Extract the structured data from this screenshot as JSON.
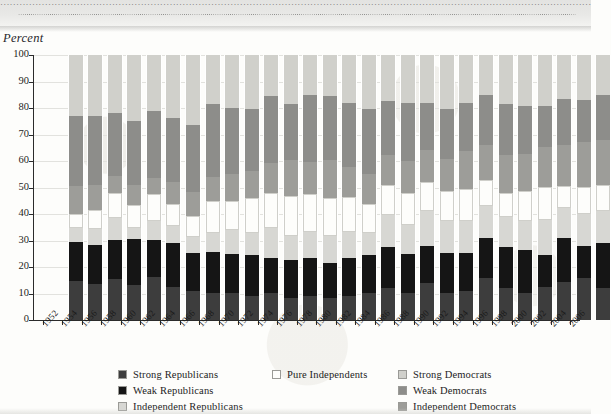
{
  "page": {
    "header_strip_text": "·····································································································································································································"
  },
  "axis": {
    "y_title": "Percent",
    "y_ticks": [
      0,
      10,
      20,
      30,
      40,
      50,
      60,
      70,
      80,
      90,
      100
    ],
    "y_tick_labels": [
      "0",
      "10",
      "20",
      "30",
      "40",
      "50",
      "60",
      "70",
      "80",
      "90",
      "100"
    ]
  },
  "legend": {
    "left": [
      {
        "label": "Strong Republicans",
        "color": "#3d3d3d"
      },
      {
        "label": "Weak Republicans",
        "color": "#151515"
      },
      {
        "label": "Independent Republicans",
        "color": "#d7d7d3"
      }
    ],
    "mid": [
      {
        "label": "Pure Independents",
        "color": "#fdfdfb"
      }
    ],
    "right": [
      {
        "label": "Strong Democrats",
        "color": "#d0d0cb"
      },
      {
        "label": "Weak Democrats",
        "color": "#8d8d8a"
      },
      {
        "label": "Independent Democrats",
        "color": "#9d9d99"
      }
    ]
  },
  "colors": {
    "strong_republicans": "#3d3d3d",
    "weak_republicans": "#151515",
    "independent_republicans": "#d7d7d3",
    "pure_independents": "#fdfdfb",
    "independent_democrats": "#9d9d99",
    "weak_democrats": "#8d8d8a",
    "strong_democrats": "#d0d0cb"
  },
  "chart_data": {
    "type": "bar",
    "stacked": true,
    "title": "",
    "xlabel": "",
    "ylabel": "Percent",
    "ylim": [
      0,
      100
    ],
    "grid": true,
    "legend_position": "bottom",
    "stack_order_bottom_to_top": [
      "Strong Republicans",
      "Weak Republicans",
      "Independent Republicans",
      "Pure Independents",
      "Independent Democrats",
      "Weak Democrats",
      "Strong Democrats"
    ],
    "categories": [
      "1952",
      "1954",
      "1956",
      "1958",
      "1960",
      "1962",
      "1964",
      "1966",
      "1968",
      "1970",
      "1972",
      "1974",
      "1976",
      "1978",
      "1980",
      "1982",
      "1984",
      "1986",
      "1988",
      "1990",
      "1992",
      "1994",
      "1996",
      "1998",
      "2000",
      "2002",
      "2004",
      "2006"
    ],
    "series": [
      {
        "name": "Strong Republicans",
        "values": [
          14,
          13,
          15,
          12,
          16,
          12,
          11,
          10,
          10,
          9,
          10,
          8,
          9,
          8,
          9,
          10,
          12,
          10,
          14,
          10,
          11,
          16,
          12,
          10,
          12,
          14,
          16,
          12
        ]
      },
      {
        "name": "Weak Republicans",
        "values": [
          14,
          14,
          14,
          16,
          14,
          16,
          14,
          15,
          15,
          15,
          13,
          14,
          14,
          13,
          14,
          14,
          15,
          15,
          14,
          15,
          14,
          15,
          15,
          16,
          12,
          16,
          12,
          17
        ]
      },
      {
        "name": "Independent Republicans",
        "values": [
          5,
          6,
          8,
          4,
          7,
          6,
          6,
          7,
          9,
          8,
          11,
          9,
          10,
          10,
          10,
          8,
          12,
          11,
          13,
          12,
          12,
          12,
          11,
          11,
          13,
          11,
          12,
          12
        ]
      },
      {
        "name": "Pure Independents",
        "values": [
          5,
          7,
          9,
          8,
          10,
          8,
          8,
          12,
          11,
          13,
          13,
          15,
          14,
          14,
          13,
          11,
          11,
          12,
          11,
          11,
          12,
          10,
          9,
          11,
          12,
          8,
          10,
          10
        ]
      },
      {
        "name": "Independent Democrats",
        "values": [
          10,
          9,
          6,
          7,
          6,
          8,
          9,
          9,
          10,
          10,
          11,
          13,
          12,
          14,
          11,
          11,
          11,
          12,
          12,
          12,
          14,
          13,
          14,
          14,
          15,
          15,
          17,
          17
        ]
      },
      {
        "name": "Weak Democrats",
        "values": [
          25,
          25,
          23,
          22,
          25,
          23,
          25,
          27,
          25,
          23,
          25,
          21,
          25,
          24,
          24,
          24,
          20,
          22,
          18,
          19,
          18,
          19,
          19,
          18,
          15,
          17,
          16,
          17
        ]
      },
      {
        "name": "Strong Democrats",
        "values": [
          22,
          22,
          21,
          23,
          21,
          23,
          26,
          18,
          20,
          20,
          15,
          18,
          15,
          15,
          18,
          20,
          17,
          18,
          18,
          20,
          18,
          15,
          18,
          19,
          19,
          16,
          17,
          15
        ]
      }
    ]
  }
}
